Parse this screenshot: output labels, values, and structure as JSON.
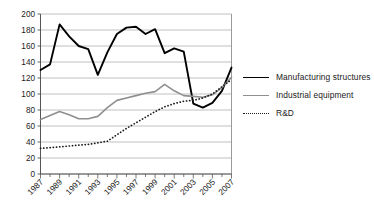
{
  "chart_data": {
    "type": "line",
    "title": "",
    "xlabel": "",
    "ylabel": "",
    "grid": true,
    "legend_position": "right",
    "ylim": [
      0,
      200
    ],
    "yticks": [
      0,
      20,
      40,
      60,
      80,
      100,
      120,
      140,
      160,
      180,
      200
    ],
    "ytick_labels": [
      "0",
      "20",
      "40",
      "60",
      "80",
      "100",
      "120",
      "140",
      "160",
      "180",
      "200"
    ],
    "x": [
      1987,
      1988,
      1989,
      1990,
      1991,
      1992,
      1993,
      1994,
      1995,
      1996,
      1997,
      1998,
      1999,
      2000,
      2001,
      2002,
      2003,
      2004,
      2005,
      2006,
      2007
    ],
    "xtick_labels": [
      "1987",
      "1989",
      "1991",
      "1993",
      "1995",
      "1997",
      "1999",
      "2001",
      "2003",
      "2005",
      "2007"
    ],
    "xtick_values": [
      1987,
      1989,
      1991,
      1993,
      1995,
      1997,
      1999,
      2001,
      2003,
      2005,
      2007
    ],
    "series": [
      {
        "name": "Manufacturing structures",
        "color": "#000000",
        "style": "solid",
        "values": [
          130,
          137,
          187,
          172,
          160,
          156,
          124,
          152,
          175,
          183,
          184,
          175,
          181,
          151,
          157,
          153,
          88,
          83,
          89,
          104,
          133
        ]
      },
      {
        "name": "Industrial equipment",
        "color": "#8f8f8f",
        "style": "solid",
        "values": [
          68,
          73,
          78,
          74,
          69,
          69,
          72,
          83,
          92,
          95,
          98,
          101,
          103,
          112,
          104,
          98,
          97,
          96,
          99,
          108,
          121
        ]
      },
      {
        "name": "R&D",
        "color": "#1a1a1a",
        "style": "dotted",
        "values": [
          32,
          33,
          34,
          35,
          36,
          37,
          39,
          41,
          49,
          57,
          64,
          71,
          78,
          84,
          88,
          91,
          92,
          95,
          100,
          109,
          118
        ]
      }
    ]
  },
  "legend": {
    "items": [
      {
        "label": "Manufacturing structures"
      },
      {
        "label": "Industrial equipment"
      },
      {
        "label": "R&D"
      }
    ]
  }
}
